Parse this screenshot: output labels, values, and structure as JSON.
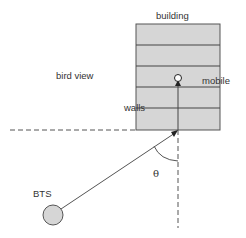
{
  "labels": {
    "building": "building",
    "bird_view": "bird view",
    "mobile": "mobile",
    "walls": "walls",
    "bts": "BTS",
    "angle": "θ"
  },
  "colors": {
    "building_fill": "#d6d6d6",
    "stroke": "#555555",
    "bts_fill": "#d6d6d6"
  },
  "building": {
    "rows": 5
  }
}
